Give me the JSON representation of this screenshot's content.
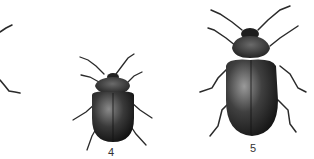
{
  "figure": {
    "specimens": [
      {
        "label": "",
        "note": "partially cropped specimen at left edge (legs only)"
      },
      {
        "label": "4",
        "note": "small rounded dark beetle"
      },
      {
        "label": "5",
        "note": "larger oval dark beetle"
      }
    ],
    "colors": {
      "background": "#ffffff",
      "body": "#2a2a2a",
      "highlight": "#7a7a7a"
    }
  }
}
